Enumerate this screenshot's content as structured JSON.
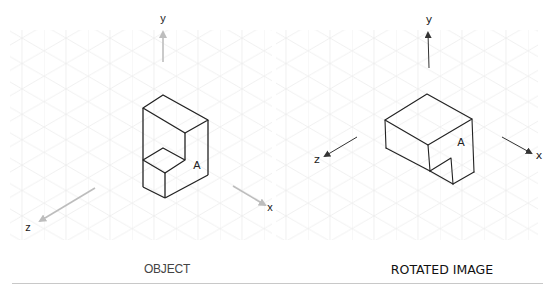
{
  "diagram": {
    "panels": [
      {
        "id": "object",
        "caption": "OBJECT",
        "axes": {
          "y": "y",
          "x": "x",
          "z": "z"
        },
        "face_label": "A",
        "axis_color": "#bdbdbd",
        "style": "clean"
      },
      {
        "id": "rotated",
        "caption": "ROTATED IMAGE",
        "axes": {
          "y": "y",
          "x": "x",
          "z": "z"
        },
        "face_label": "A",
        "axis_color": "#333333",
        "style": "hand-drawn"
      }
    ],
    "grid": {
      "type": "isometric",
      "color": "#ececec"
    },
    "line_color": "#222222"
  }
}
